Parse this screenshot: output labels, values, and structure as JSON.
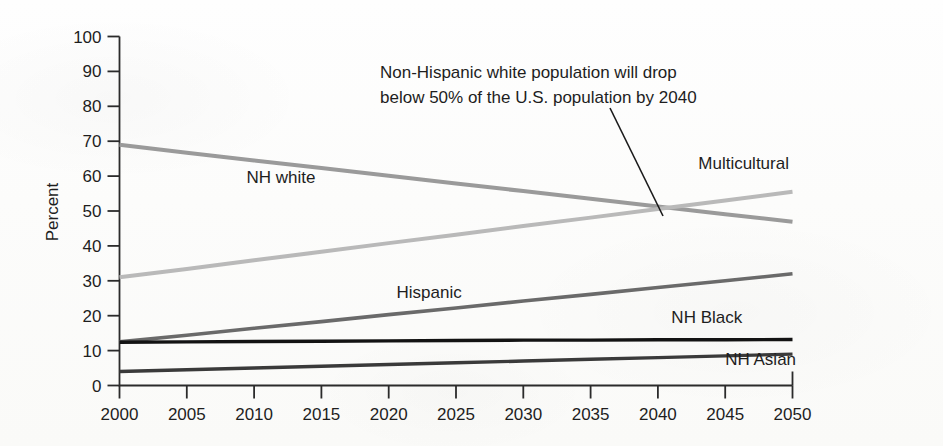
{
  "chart_data": {
    "type": "line",
    "title": "",
    "xlabel": "",
    "ylabel": "Percent",
    "x": [
      2000,
      2005,
      2010,
      2015,
      2020,
      2025,
      2030,
      2035,
      2040,
      2045,
      2050
    ],
    "xlim": [
      2000,
      2050
    ],
    "ylim": [
      0,
      100
    ],
    "y_ticks": [
      0,
      10,
      20,
      30,
      40,
      50,
      60,
      70,
      80,
      90,
      100
    ],
    "x_ticks": [
      2000,
      2005,
      2010,
      2015,
      2020,
      2025,
      2030,
      2035,
      2040,
      2045,
      2050
    ],
    "grid": false,
    "legend_position": "inline-labels",
    "series": [
      {
        "name": "NH white",
        "color": "#9a9a9a",
        "width": 4.0,
        "label_x": 2012,
        "label_y": 58,
        "values": [
          69.0,
          66.7,
          64.5,
          62.3,
          60.1,
          57.9,
          55.7,
          53.5,
          51.3,
          49.1,
          46.9
        ]
      },
      {
        "name": "Multicultural",
        "color": "#b9b9b9",
        "width": 4.0,
        "label_x": 2043,
        "label_y": 62,
        "values": [
          31.0,
          33.4,
          35.9,
          38.3,
          40.8,
          43.2,
          45.7,
          48.1,
          50.6,
          53.0,
          55.5
        ]
      },
      {
        "name": "Hispanic",
        "color": "#6a6a6a",
        "width": 3.6,
        "label_x": 2023,
        "label_y": 25,
        "values": [
          12.5,
          14.4,
          16.4,
          18.3,
          20.3,
          22.2,
          24.2,
          26.1,
          28.1,
          30.0,
          32.0
        ]
      },
      {
        "name": "NH Black",
        "color": "#131313",
        "width": 3.4,
        "label_x": 2041,
        "label_y": 18,
        "values": [
          12.4,
          12.5,
          12.6,
          12.7,
          12.8,
          12.9,
          13.0,
          13.0,
          13.1,
          13.1,
          13.2
        ]
      },
      {
        "name": "NH Asian",
        "color": "#3a3a3a",
        "width": 3.4,
        "label_x": 2045,
        "label_y": 6,
        "values": [
          4.0,
          4.5,
          5.0,
          5.5,
          6.0,
          6.5,
          7.0,
          7.5,
          8.0,
          8.5,
          9.0
        ]
      }
    ],
    "annotations": [
      {
        "id": "crossover-note",
        "line1": "Non-Hispanic white population will drop",
        "line2": "below 50% of the U.S. population by 2040",
        "text_x": 380,
        "text_y": 78,
        "leader_from_x": 610,
        "leader_from_y": 108,
        "leader_to_x": 663,
        "leader_to_y": 216
      }
    ]
  },
  "axis": {
    "y_title": "Percent"
  }
}
